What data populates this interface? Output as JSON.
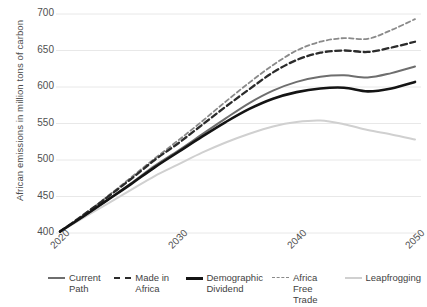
{
  "chart_data": {
    "type": "line",
    "title": "",
    "xlabel": "",
    "ylabel": "African emissions in million tons of carbon",
    "xlim": [
      2020,
      2050
    ],
    "ylim": [
      400,
      700
    ],
    "yticks": [
      400,
      450,
      500,
      550,
      600,
      650,
      700
    ],
    "xticks": [
      2020,
      2030,
      2040,
      2050
    ],
    "grid": "horizontal",
    "legend_position": "bottom",
    "x": [
      2020,
      2022,
      2024,
      2026,
      2028,
      2030,
      2032,
      2034,
      2036,
      2038,
      2040,
      2042,
      2044,
      2046,
      2048,
      2050
    ],
    "series": [
      {
        "name": "Current Path",
        "color": "#6e6e6e",
        "style": "solid",
        "width": 2.0,
        "values": [
          402,
          423,
          445,
          468,
          492,
          513,
          535,
          557,
          578,
          595,
          607,
          614,
          616,
          613,
          619,
          628
        ]
      },
      {
        "name": "Made in Africa",
        "color": "#2b2b2b",
        "style": "dashed",
        "width": 2.3,
        "values": [
          402,
          425,
          449,
          474,
          500,
          523,
          548,
          573,
          597,
          620,
          637,
          647,
          650,
          648,
          654,
          662
        ]
      },
      {
        "name": "Demographic Dividend",
        "color": "#141414",
        "style": "solid",
        "width": 2.6,
        "values": [
          402,
          423,
          445,
          467,
          490,
          511,
          532,
          552,
          570,
          584,
          593,
          598,
          599,
          594,
          598,
          607
        ]
      },
      {
        "name": "Africa Free Trade",
        "color": "#8a8a8a",
        "style": "dashed",
        "width": 1.8,
        "values": [
          402,
          425,
          450,
          476,
          502,
          527,
          553,
          580,
          606,
          630,
          650,
          662,
          667,
          666,
          678,
          693
        ]
      },
      {
        "name": "Leapfrogging",
        "color": "#d0d0d0",
        "style": "solid",
        "width": 2.0,
        "values": [
          402,
          421,
          440,
          459,
          478,
          494,
          510,
          524,
          536,
          546,
          552,
          554,
          549,
          541,
          535,
          528
        ]
      }
    ]
  },
  "axis": {
    "ytick_labels": [
      "700",
      "650",
      "600",
      "550",
      "500",
      "450",
      "400"
    ],
    "xtick_labels": [
      "2020",
      "2030",
      "2040",
      "2050"
    ],
    "ylabel": "African emissions in million tons of carbon"
  },
  "legend": {
    "items": [
      {
        "label": "Current Path",
        "color": "#6e6e6e",
        "style": "solid",
        "width": 2
      },
      {
        "label": "Made in Africa",
        "color": "#2b2b2b",
        "style": "dashed",
        "width": 2.4
      },
      {
        "label": "Demographic Dividend",
        "color": "#141414",
        "style": "solid",
        "width": 2.8
      },
      {
        "label": "Africa Free Trade",
        "color": "#8a8a8a",
        "style": "dashed",
        "width": 1.8
      },
      {
        "label": "Leapfrogging",
        "color": "#d0d0d0",
        "style": "solid",
        "width": 2
      }
    ]
  },
  "theme": {
    "background": "#ffffff",
    "grid_color": "#e8e8e8",
    "text_color": "#4a4a4a"
  }
}
